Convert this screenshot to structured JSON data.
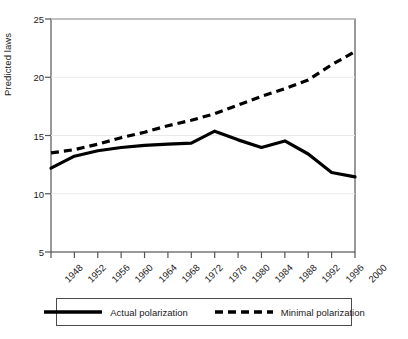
{
  "chart_data": {
    "type": "line",
    "title": "",
    "xlabel": "",
    "ylabel": "Predicted laws",
    "x": [
      1948,
      1952,
      1956,
      1960,
      1964,
      1968,
      1972,
      1976,
      1980,
      1984,
      1988,
      1992,
      1996,
      2000
    ],
    "xlim": [
      1948,
      2000
    ],
    "ylim": [
      4.2,
      25.6
    ],
    "yticks": [
      5,
      10,
      15,
      20,
      25
    ],
    "xticks": [
      1948,
      1952,
      1956,
      1960,
      1964,
      1968,
      1972,
      1976,
      1980,
      1984,
      1988,
      1992,
      1996,
      2000
    ],
    "grid": "horizontal",
    "legend_position": "below",
    "series": [
      {
        "name": "Actual polarization",
        "style": "solid",
        "color": "#000000",
        "values": [
          11.9,
          13.0,
          13.5,
          13.8,
          14.0,
          14.1,
          14.2,
          15.3,
          14.5,
          13.8,
          14.4,
          13.2,
          11.5,
          11.1
        ]
      },
      {
        "name": "Minimal polarization",
        "style": "dashed",
        "color": "#000000",
        "values": [
          13.3,
          13.6,
          14.1,
          14.7,
          15.2,
          15.8,
          16.3,
          16.9,
          17.7,
          18.5,
          19.2,
          20.0,
          21.4,
          22.6
        ]
      }
    ]
  },
  "axis": {
    "ylabel": "Predicted laws",
    "ytick_labels": [
      "25",
      "20",
      "15",
      "10",
      "5"
    ],
    "xtick_labels": [
      "1948",
      "1952",
      "1956",
      "1960",
      "1964",
      "1968",
      "1972",
      "1976",
      "1980",
      "1984",
      "1988",
      "1992",
      "1996",
      "2000"
    ]
  },
  "legend": {
    "entries": [
      {
        "label": "Actual polarization",
        "style": "solid"
      },
      {
        "label": "Minimal polarization",
        "style": "dashed"
      }
    ]
  }
}
